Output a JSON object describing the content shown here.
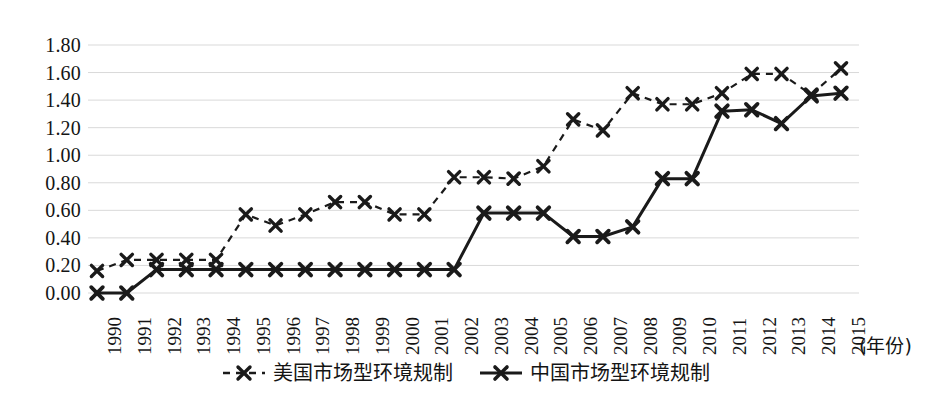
{
  "chart_data": {
    "type": "line",
    "title": "",
    "xlabel": "(年份)",
    "ylabel": "",
    "x": [
      1990,
      1991,
      1992,
      1993,
      1994,
      1995,
      1996,
      1997,
      1998,
      1999,
      2000,
      2001,
      2002,
      2003,
      2004,
      2005,
      2006,
      2007,
      2008,
      2009,
      2010,
      2011,
      2012,
      2013,
      2014,
      2015
    ],
    "categories": [
      "1990",
      "1991",
      "1992",
      "1993",
      "1994",
      "1995",
      "1996",
      "1997",
      "1998",
      "1999",
      "2000",
      "2001",
      "2002",
      "2003",
      "2004",
      "2005",
      "2006",
      "2007",
      "2008",
      "2009",
      "2010",
      "2011",
      "2012",
      "2013",
      "2014",
      "2015"
    ],
    "series": [
      {
        "name": "美国市场型环境规制",
        "style": "dashed",
        "marker": "x",
        "color": "#1a1a1a",
        "values": [
          0.16,
          0.24,
          0.24,
          0.24,
          0.24,
          0.57,
          0.49,
          0.57,
          0.66,
          0.66,
          0.57,
          0.57,
          0.84,
          0.84,
          0.83,
          0.92,
          1.26,
          1.18,
          1.45,
          1.37,
          1.37,
          1.45,
          1.59,
          1.59,
          1.44,
          1.63
        ]
      },
      {
        "name": "中国市场型环境规制",
        "style": "solid",
        "marker": "x",
        "color": "#1a1a1a",
        "values": [
          0.0,
          0.0,
          0.17,
          0.17,
          0.17,
          0.17,
          0.17,
          0.17,
          0.17,
          0.17,
          0.17,
          0.17,
          0.17,
          0.58,
          0.58,
          0.58,
          0.41,
          0.41,
          0.48,
          0.83,
          0.83,
          1.32,
          1.33,
          1.23,
          1.43,
          1.45
        ]
      }
    ],
    "yticks": [
      "0.00",
      "0.20",
      "0.40",
      "0.60",
      "0.80",
      "1.00",
      "1.20",
      "1.40",
      "1.60",
      "1.80"
    ],
    "ytick_values": [
      0.0,
      0.2,
      0.4,
      0.6,
      0.8,
      1.0,
      1.2,
      1.4,
      1.6,
      1.8
    ],
    "ylim": [
      0.0,
      1.8
    ],
    "grid": "horizontal",
    "legend_position": "bottom-center",
    "gridline_color": "#d9d9d9",
    "background": "#ffffff"
  },
  "legend": {
    "entries": [
      {
        "label": "美国市场型环境规制",
        "style": "dashed"
      },
      {
        "label": "中国市场型环境规制",
        "style": "solid"
      }
    ]
  },
  "axis": {
    "x_unit_label": "(年份)"
  }
}
